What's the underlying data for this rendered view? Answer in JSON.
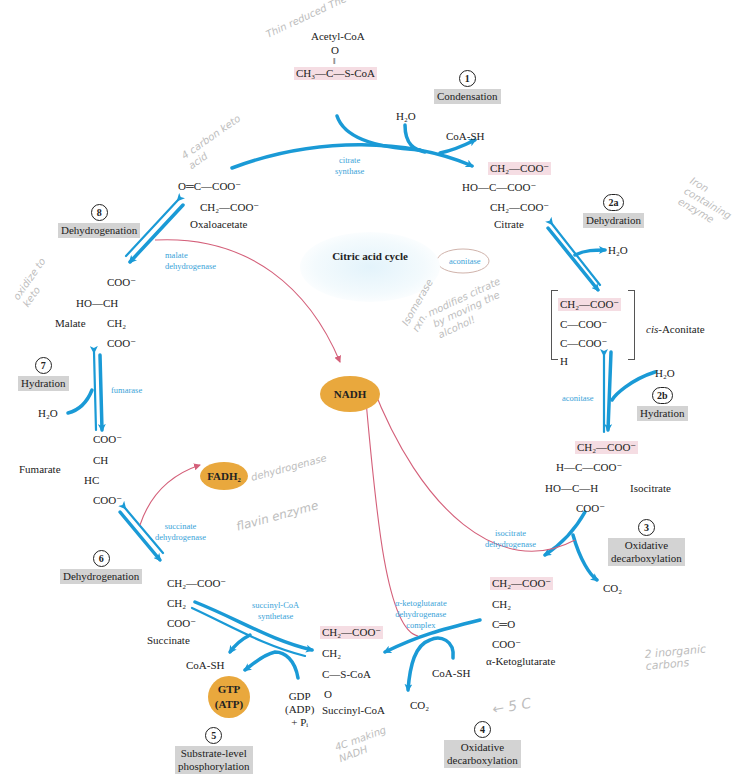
{
  "title": "Citric acid cycle",
  "colors": {
    "flow": "#1a9ad6",
    "enzyme": "#3aa3d8",
    "electron": "#d4607a",
    "carrier": "#e9a83d",
    "step_label_bg": "#d3d3d3",
    "highlight": "#f5dde3",
    "handwriting": "#bdbdbd"
  },
  "steps": [
    {
      "num": "1",
      "label": "Condensation"
    },
    {
      "num": "2a",
      "label": "Dehydration"
    },
    {
      "num": "2b",
      "label": "Hydration"
    },
    {
      "num": "3",
      "label": "Oxidative\ndecarboxylation"
    },
    {
      "num": "4",
      "label": "Oxidative\ndecarboxylation"
    },
    {
      "num": "5",
      "label": "Substrate-level\nphosphorylation"
    },
    {
      "num": "6",
      "label": "Dehydrogenation"
    },
    {
      "num": "7",
      "label": "Hydration"
    },
    {
      "num": "8",
      "label": "Dehydrogenation"
    }
  ],
  "enzymes": {
    "citrate_synthase": "citrate\nsynthase",
    "aconitase_1": "aconitase",
    "aconitase_2": "aconitase",
    "isocitrate_dh": "isocitrate\ndehydrogenase",
    "akg_dh": "α-ketoglutarate\ndehydrogenase\ncomplex",
    "succinyl_coa_synthetase": "succinyl-CoA\nsynthetase",
    "succinate_dh": "succinate\ndehydrogenase",
    "fumarase": "fumarase",
    "malate_dh": "malate\ndehydrogenase"
  },
  "compounds": {
    "acetyl_coa": {
      "name": "Acetyl-CoA",
      "o": "O",
      "dbl": "‖",
      "formula": "CH₃—C—S-CoA"
    },
    "citrate": {
      "name": "Citrate",
      "l1": "CH₂—COO⁻",
      "l2": "HO—C—COO⁻",
      "l3": "CH₂—COO⁻"
    },
    "cis_aconitate": {
      "name": "cis-Aconitate",
      "name_italic": "cis",
      "name_rest": "-Aconitate",
      "l1": "CH₂—COO⁻",
      "l2": "C—COO⁻",
      "l3": "C—COO⁻",
      "l4": "H"
    },
    "isocitrate": {
      "name": "Isocitrate",
      "l1": "CH₂—COO⁻",
      "l2": "H—C—COO⁻",
      "l3": "HO—C—H",
      "l4": "COO⁻"
    },
    "a_ketoglutarate": {
      "name": "α-Ketoglutarate",
      "l1": "CH₂—COO⁻",
      "l2": "CH₂",
      "l3": "C═O",
      "l4": "COO⁻"
    },
    "succinyl_coa": {
      "name": "Succinyl-CoA",
      "l1": "CH₂—COO⁻",
      "l2": "CH₂",
      "l3": "C—S-CoA",
      "l4": "O"
    },
    "succinate": {
      "name": "Succinate",
      "l1": "CH₂—COO⁻",
      "l2": "CH₂",
      "l3": "COO⁻"
    },
    "fumarate": {
      "name": "Fumarate",
      "l1": "COO⁻",
      "l2": "CH",
      "l3": "HC",
      "l4": "COO⁻"
    },
    "malate": {
      "name": "Malate",
      "l1": "COO⁻",
      "l2": "HO—CH",
      "l3": "CH₂",
      "l4": "COO⁻"
    },
    "oxaloacetate": {
      "name": "Oxaloacetate",
      "l1": "O═C—COO⁻",
      "l2": "CH₂—COO⁻"
    }
  },
  "side_molecules": {
    "h2o_1": "H₂O",
    "coash_1": "CoA-SH",
    "h2o_2a": "H₂O",
    "h2o_2b": "H₂O",
    "co2_3": "CO₂",
    "coash_4": "CoA-SH",
    "co2_4": "CO₂",
    "coash_5": "CoA-SH",
    "gdp": "GDP\n(ADP)\n+ Pᵢ",
    "h2o_7": "H₂O"
  },
  "carriers": {
    "nadh": "NADH",
    "fadh2": "FADH₂",
    "gtp": "GTP\n(ATP)"
  },
  "handwritten_notes": [
    "Thin reduced The to",
    "4 carbon keto acid",
    "oxidize to keto",
    "Isomerase rxn.",
    "modifies citrate by moving the alcohol!",
    "Iron containing enzyme",
    "dehydrogenase",
    "flavin enzyme",
    "← 5 C",
    "4C making NADH",
    "2 inorganic carbons"
  ]
}
